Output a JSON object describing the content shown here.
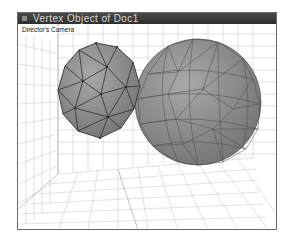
{
  "window": {
    "title": "Vertex Object of Doc1"
  },
  "viewport": {
    "camera_label": "Director's Camera",
    "objects": [
      {
        "name": "icosphere-low",
        "shape": "geodesic sphere (coarse)",
        "color": "#8c8c8c"
      },
      {
        "name": "icosphere-high",
        "shape": "geodesic sphere (fine)",
        "color": "#8c8c8c"
      }
    ],
    "grid_color": "#c8c8c8"
  }
}
